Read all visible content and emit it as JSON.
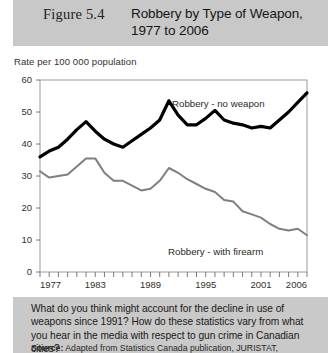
{
  "header": {
    "figure_number": "Figure 5.4",
    "title_line1": "Robbery by Type of Weapon,",
    "title_line2": "1977 to 2006",
    "band_color": "#c8c8c8"
  },
  "footer": {
    "question": "What do you think might account for the decline in use of weapons since 1991? How do these statistics vary from what you hear in the media with respect to gun crime in Canadian cities?",
    "source_label": "Source:",
    "source_text": " Adapted from Statistics Canada publication, JURISTAT,",
    "band_color": "#c9c9c9"
  },
  "chart_data": {
    "type": "line",
    "title": "Robbery by Type of Weapon, 1977 to 2006",
    "xlabel": "",
    "ylabel": "Rate per 100 000 population",
    "ylim": [
      0,
      60
    ],
    "xlim": [
      1977,
      2006
    ],
    "grid": false,
    "legend_position": "inline-annotation",
    "ytick_labels": [
      "0",
      "10",
      "20",
      "30",
      "40",
      "50",
      "60"
    ],
    "yticks": [
      0,
      10,
      20,
      30,
      40,
      50,
      60
    ],
    "xtick_labels": [
      "1977",
      "1983",
      "1989",
      "1995",
      "2001",
      "2006"
    ],
    "xticks": [
      1977,
      1983,
      1989,
      1995,
      2001,
      2006
    ],
    "x": [
      1977,
      1978,
      1979,
      1980,
      1981,
      1982,
      1983,
      1984,
      1985,
      1986,
      1987,
      1988,
      1989,
      1990,
      1991,
      1992,
      1993,
      1994,
      1995,
      1996,
      1997,
      1998,
      1999,
      2000,
      2001,
      2002,
      2003,
      2004,
      2005,
      2006
    ],
    "series": [
      {
        "name": "Robbery - no weapon",
        "color": "#000000",
        "width": 3.2,
        "values": [
          36.0,
          37.8,
          39.0,
          41.5,
          44.5,
          47.0,
          44.0,
          41.5,
          40.0,
          39.0,
          41.0,
          43.0,
          45.0,
          47.5,
          53.5,
          49.0,
          46.0,
          46.0,
          48.0,
          50.5,
          47.5,
          46.5,
          46.0,
          45.0,
          45.5,
          45.0,
          47.5,
          50.0,
          53.0,
          56.0
        ]
      },
      {
        "name": "Robbery - with firearm",
        "color": "#7f7f7f",
        "width": 2.0,
        "values": [
          31.5,
          29.5,
          30.0,
          30.5,
          33.0,
          35.5,
          35.5,
          31.0,
          28.5,
          28.5,
          27.0,
          25.5,
          26.0,
          28.5,
          32.5,
          31.0,
          29.0,
          27.5,
          26.0,
          25.0,
          22.5,
          22.0,
          19.0,
          18.0,
          17.0,
          15.0,
          13.5,
          13.0,
          13.5,
          11.5
        ]
      }
    ],
    "annotations": [
      {
        "text": "Robbery - no weapon",
        "near_x": 1993,
        "near_y": 55
      },
      {
        "text": "Robbery - with firearm",
        "near_x": 1993,
        "near_y": 7
      }
    ]
  }
}
